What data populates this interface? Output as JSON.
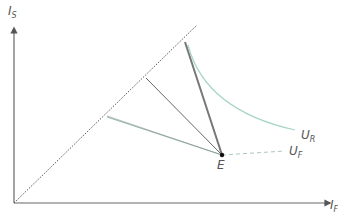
{
  "diagram": {
    "y_axis_label": "I",
    "y_axis_sub": "S",
    "x_axis_label": "I",
    "x_axis_sub": "F",
    "curve_r_label": "U",
    "curve_r_sub": "R",
    "curve_f_label": "U",
    "curve_f_sub": "F",
    "point_label": "E",
    "colors": {
      "axis": "#555555",
      "diagonal": "#555555",
      "line": "#666666",
      "curve": "#a8d5c8",
      "dashed": "#a8c8c0"
    }
  }
}
